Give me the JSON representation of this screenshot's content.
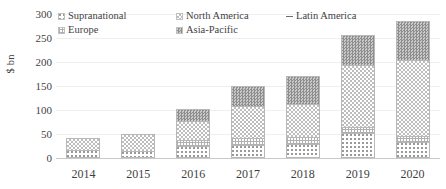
{
  "chart_data": {
    "type": "bar",
    "stacked": true,
    "title": "",
    "xlabel": "",
    "ylabel": "$ bn",
    "ylim": [
      0,
      300
    ],
    "yticks": [
      0,
      50,
      100,
      150,
      200,
      250,
      300
    ],
    "grid": true,
    "legend_position": "top-left",
    "categories": [
      "2014",
      "2015",
      "2016",
      "2017",
      "2018",
      "2019",
      "2020"
    ],
    "series": [
      {
        "name": "Supranational",
        "values": [
          16,
          15,
          25,
          27,
          29,
          52,
          33
        ]
      },
      {
        "name": "Europe",
        "values": [
          0,
          0,
          13,
          14,
          14,
          13,
          12
        ]
      },
      {
        "name": "North America",
        "values": [
          26,
          35,
          39,
          68,
          70,
          129,
          159
        ]
      },
      {
        "name": "Asia-Pacific",
        "values": [
          0,
          0,
          25,
          42,
          57,
          62,
          81
        ]
      },
      {
        "name": "Latin America",
        "values": [
          0,
          0,
          0,
          0,
          0,
          0,
          0
        ]
      }
    ],
    "totals": [
      42,
      50,
      102,
      151,
      170,
      256,
      285
    ]
  },
  "axes": {
    "y_title": "$ bn",
    "y_ticks": [
      "300",
      "250",
      "200",
      "150",
      "100",
      "50",
      "0"
    ],
    "x_ticks": [
      "2014",
      "2015",
      "2016",
      "2017",
      "2018",
      "2019",
      "2020"
    ]
  },
  "legend": {
    "items": [
      {
        "label": "Supranational",
        "swatch": "dotted-light-swatch",
        "color": "#9a9a9a"
      },
      {
        "label": "North America",
        "swatch": "checker-light-swatch",
        "color": "#bdbdbd"
      },
      {
        "label": "Latin America",
        "swatch": "line-marker-swatch",
        "color": "#6e6e6e"
      },
      {
        "label": "Europe",
        "swatch": "grid-hatch-swatch",
        "color": "#b0b0b0"
      },
      {
        "label": "Asia-Pacific",
        "swatch": "checker-dark-swatch",
        "color": "#8e8e8e"
      }
    ]
  }
}
